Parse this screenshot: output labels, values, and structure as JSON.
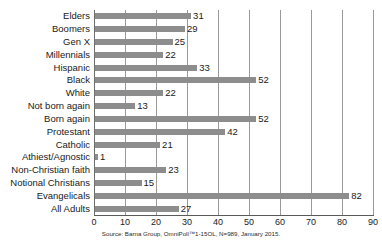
{
  "chart_data": {
    "type": "bar",
    "orientation": "horizontal",
    "title": "",
    "subtitle": "",
    "xlabel": "",
    "ylabel": "",
    "xlim": [
      0,
      90
    ],
    "xticks": [
      0,
      10,
      20,
      30,
      40,
      50,
      60,
      70,
      80,
      90
    ],
    "xtick_labels": [
      "0",
      "10",
      "20",
      "30",
      "40",
      "50",
      "60",
      "70",
      "80",
      "90"
    ],
    "grid": true,
    "grid_axis": "x",
    "legend": false,
    "legend_position": "none",
    "bar_color": "#8d8d8d",
    "gridline_color": "#9a9a9a",
    "background": "#ffffff",
    "categories": [
      "Elders",
      "Boomers",
      "Gen X",
      "Millennials",
      "Hispanic",
      "Black",
      "White",
      "Not born again",
      "Born again",
      "Protestant",
      "Catholic",
      "Athiest/Agnostic",
      "Non-Christian faith",
      "Notional Christians",
      "Evangelicals",
      "All Adults"
    ],
    "values": [
      31,
      29,
      25,
      22,
      33,
      52,
      22,
      13,
      52,
      42,
      21,
      1,
      23,
      15,
      82,
      27
    ],
    "data_labels": [
      "31",
      "29",
      "25",
      "22",
      "33",
      "52",
      "22",
      "13",
      "52",
      "42",
      "21",
      "1",
      "23",
      "15",
      "82",
      "27"
    ],
    "annotations": [
      "Source: Barna Group, OmniPoll™1-15OL, N=989, January 2015."
    ]
  },
  "footer": {
    "source": "Source: Barna Group, OmniPoll™1-15OL, N=989, January 2015."
  }
}
